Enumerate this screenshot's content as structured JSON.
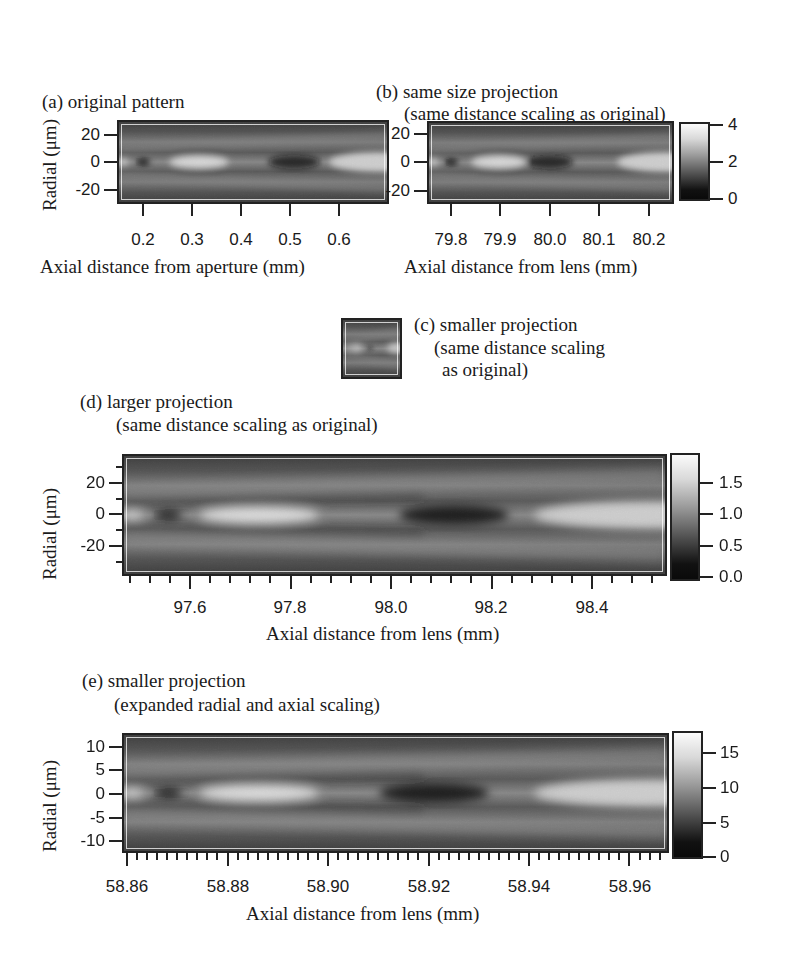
{
  "figure": {
    "panels": {
      "a": {
        "title": "(a) original pattern",
        "xlabel": "Axial distance from aperture (mm)",
        "ylabel": "Radial (μm)",
        "xticks": [
          "0.2",
          "0.3",
          "0.4",
          "0.5",
          "0.6"
        ],
        "yticks": [
          "20",
          "0",
          "-20"
        ]
      },
      "b": {
        "title": "(b) same size projection",
        "subtitle": "(same distance scaling as original)",
        "xlabel": "Axial distance from lens (mm)",
        "xticks": [
          "79.8",
          "79.9",
          "80.0",
          "80.1",
          "80.2"
        ],
        "yticks": [
          "20",
          "0",
          "-20"
        ],
        "colorbar_ticks": [
          "4",
          "2",
          "0"
        ]
      },
      "c": {
        "title": "(c) smaller projection",
        "subtitle_line1": "(same distance scaling",
        "subtitle_line2": "as original)"
      },
      "d": {
        "title": "(d) larger projection",
        "subtitle": "(same distance scaling as original)",
        "xlabel": "Axial distance from lens (mm)",
        "ylabel": "Radial (μm)",
        "xticks": [
          "97.6",
          "97.8",
          "98.0",
          "98.2",
          "98.4"
        ],
        "yticks": [
          "20",
          "0",
          "-20"
        ],
        "colorbar_ticks": [
          "1.5",
          "1.0",
          "0.5",
          "0.0"
        ]
      },
      "e": {
        "title": "(e) smaller projection",
        "subtitle": "(expanded radial and axial scaling)",
        "xlabel": "Axial distance from lens (mm)",
        "ylabel": "Radial (μm)",
        "xticks": [
          "58.86",
          "58.88",
          "58.90",
          "58.92",
          "58.94",
          "58.96"
        ],
        "yticks": [
          "10",
          "5",
          "0",
          "-5",
          "-10"
        ],
        "colorbar_ticks": [
          "15",
          "10",
          "5",
          "0"
        ]
      }
    }
  },
  "chart_data": [
    {
      "type": "heatmap",
      "title": "(a) original pattern",
      "xlabel": "Axial distance from aperture (mm)",
      "ylabel": "Radial (μm)",
      "xlim": [
        0.15,
        0.65
      ],
      "ylim": [
        -27,
        27
      ],
      "xticks": [
        0.2,
        0.3,
        0.4,
        0.5,
        0.6
      ],
      "yticks": [
        20,
        0,
        -20
      ],
      "colormap": "grayscale",
      "features": [
        {
          "kind": "bright",
          "x": 0.15,
          "y": 0
        },
        {
          "kind": "dark",
          "x": 0.2,
          "y": 0
        },
        {
          "kind": "bright",
          "x": 0.28,
          "y": 0
        },
        {
          "kind": "dark",
          "x": 0.4,
          "y": 0
        },
        {
          "kind": "bright",
          "x": 0.63,
          "y": 0
        }
      ]
    },
    {
      "type": "heatmap",
      "title": "(b) same size projection (same distance scaling as original)",
      "xlabel": "Axial distance from lens (mm)",
      "ylabel": "Radial (μm)",
      "xlim": [
        79.75,
        80.25
      ],
      "ylim": [
        -27,
        27
      ],
      "xticks": [
        79.8,
        79.9,
        80.0,
        80.1,
        80.2
      ],
      "yticks": [
        20,
        0,
        -20
      ],
      "colorbar": {
        "range": [
          0,
          4
        ],
        "ticks": [
          0,
          2,
          4
        ]
      },
      "colormap": "grayscale"
    },
    {
      "type": "heatmap",
      "title": "(c) smaller projection (same distance scaling as original)",
      "colormap": "grayscale",
      "note": "small thumbnail, no axes"
    },
    {
      "type": "heatmap",
      "title": "(d) larger projection (same distance scaling as original)",
      "xlabel": "Axial distance from lens (mm)",
      "ylabel": "Radial (μm)",
      "xlim": [
        97.46,
        98.54
      ],
      "ylim": [
        -37,
        37
      ],
      "xticks": [
        97.6,
        97.8,
        98.0,
        98.2,
        98.4
      ],
      "yticks": [
        20,
        0,
        -20
      ],
      "colorbar": {
        "range": [
          0,
          1.8
        ],
        "ticks": [
          0.0,
          0.5,
          1.0,
          1.5
        ]
      },
      "colormap": "grayscale",
      "features": [
        {
          "kind": "dark",
          "x": 97.56,
          "y": 0
        },
        {
          "kind": "bright",
          "x": 97.7,
          "y": 0
        },
        {
          "kind": "dark",
          "x": 97.98,
          "y": 0
        },
        {
          "kind": "bright",
          "x": 98.5,
          "y": 0
        }
      ]
    },
    {
      "type": "heatmap",
      "title": "(e) smaller projection (expanded radial and axial scaling)",
      "xlabel": "Axial distance from lens (mm)",
      "ylabel": "Radial (μm)",
      "xlim": [
        58.855,
        58.967
      ],
      "ylim": [
        -12,
        12
      ],
      "xticks": [
        58.86,
        58.88,
        58.9,
        58.92,
        58.94,
        58.96
      ],
      "yticks": [
        10,
        5,
        0,
        -5,
        -10
      ],
      "colorbar": {
        "range": [
          0,
          18
        ],
        "ticks": [
          0,
          5,
          10,
          15
        ]
      },
      "colormap": "grayscale",
      "features": [
        {
          "kind": "dark",
          "x": 58.868,
          "y": 0
        },
        {
          "kind": "bright",
          "x": 58.884,
          "y": 0
        },
        {
          "kind": "dark",
          "x": 58.913,
          "y": 0
        },
        {
          "kind": "bright",
          "x": 58.965,
          "y": 0
        }
      ]
    }
  ]
}
